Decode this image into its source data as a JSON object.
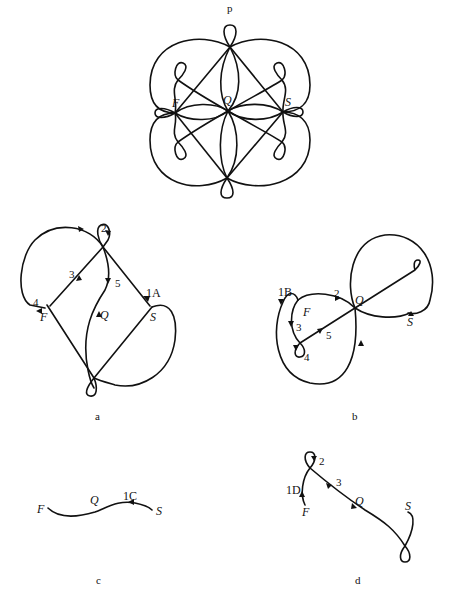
{
  "header": {
    "mark": "p"
  },
  "figures": {
    "top": {
      "labels": {
        "F": "F",
        "Q": "Q",
        "S": "S"
      }
    },
    "a": {
      "caption": "a",
      "labels": {
        "F": "F",
        "Q": "Q",
        "S": "S"
      },
      "steps": [
        "1A",
        "2",
        "3",
        "4",
        "5"
      ]
    },
    "b": {
      "caption": "b",
      "labels": {
        "F": "F",
        "Q": "Q",
        "S": "S"
      },
      "steps": [
        "1B",
        "2",
        "3",
        "4",
        "5"
      ]
    },
    "c": {
      "caption": "c",
      "labels": {
        "F": "F",
        "Q": "Q",
        "S": "S"
      },
      "steps": [
        "1C"
      ]
    },
    "d": {
      "caption": "d",
      "labels": {
        "F": "F",
        "Q": "Q",
        "S": "S"
      },
      "steps": [
        "1D",
        "2",
        "3"
      ]
    }
  }
}
